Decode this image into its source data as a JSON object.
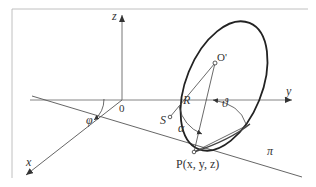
{
  "diagram": {
    "type": "3d-geometry",
    "colors": {
      "stroke": "#444444",
      "ellipse": "#222222",
      "frame": "#aaaaaa",
      "text": "#333333"
    },
    "labels": {
      "z_axis": "z",
      "y_axis": "y",
      "x_axis": "x",
      "origin": "0",
      "circle_center": "O'",
      "radius": "R",
      "point_s": "S",
      "point_p": "P(x, y, z)",
      "angle_alpha": "α",
      "angle_theta": "ϑ",
      "angle_phi": "φ",
      "plane": "π"
    }
  }
}
